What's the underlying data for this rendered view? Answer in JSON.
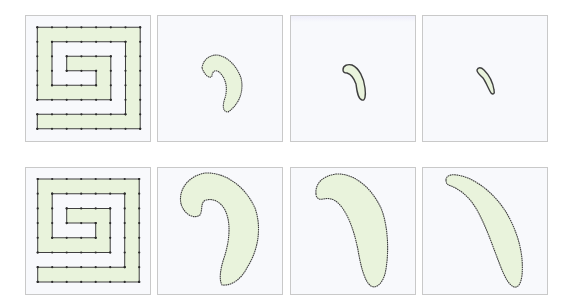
{
  "figure": {
    "colors": {
      "fill": "#e9f3dc",
      "stroke": "#3f3f3f",
      "vertex": "#2b2b2b",
      "panel_border": "#c9c9c9",
      "panel_bg": "#f8f9fc"
    },
    "rows": [
      {
        "name": "top-row",
        "panels": [
          {
            "label": "spiral-initial",
            "type": "spiral"
          },
          {
            "label": "hook-shape-shrinking",
            "type": "curve"
          },
          {
            "label": "comma-shape-small",
            "type": "curve"
          },
          {
            "label": "sliver-shape-smallest",
            "type": "curve"
          }
        ]
      },
      {
        "name": "bottom-row",
        "panels": [
          {
            "label": "spiral-initial",
            "type": "spiral"
          },
          {
            "label": "hook-shape-large",
            "type": "curve"
          },
          {
            "label": "curved-shape",
            "type": "curve"
          },
          {
            "label": "banana-shape",
            "type": "curve"
          }
        ]
      }
    ]
  }
}
